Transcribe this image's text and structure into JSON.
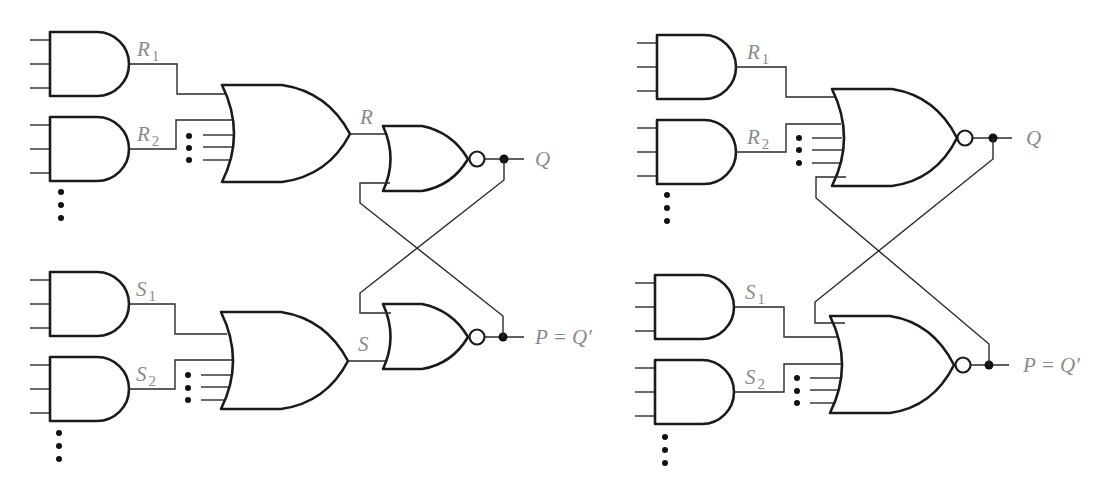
{
  "figure": {
    "colors": {
      "gate_stroke": "#1a1a1a",
      "wire": "#2a2a2a",
      "label": "#8a8a8a",
      "background": "#ffffff"
    }
  },
  "left_circuit": {
    "and_labels": [
      {
        "main": "R",
        "sub": "1"
      },
      {
        "main": "R",
        "sub": "2"
      },
      {
        "main": "S",
        "sub": "1"
      },
      {
        "main": "S",
        "sub": "2"
      }
    ],
    "or_outputs": {
      "top": "R",
      "bottom": "S"
    },
    "outputs": {
      "top": "Q",
      "bottom": "P = Q′"
    }
  },
  "right_circuit": {
    "and_labels": [
      {
        "main": "R",
        "sub": "1"
      },
      {
        "main": "R",
        "sub": "2"
      },
      {
        "main": "S",
        "sub": "1"
      },
      {
        "main": "S",
        "sub": "2"
      }
    ],
    "outputs": {
      "top": "Q",
      "bottom": "P = Q′"
    }
  }
}
